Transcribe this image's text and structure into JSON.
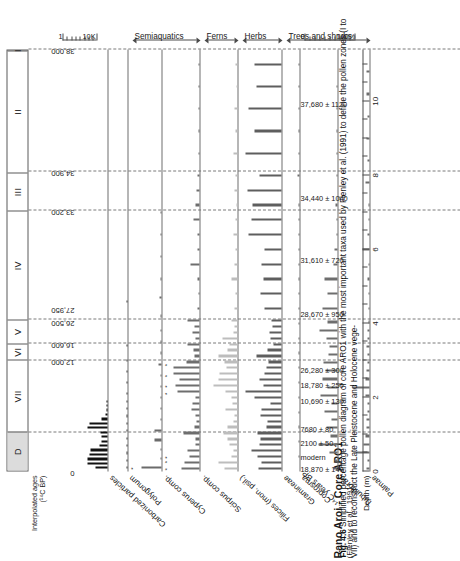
{
  "figure": {
    "title": "Rano Aroi - Core ARO1",
    "subtitle": "(Flenley et al., 1991)",
    "caption_number": "Fig. 4.6",
    "caption_text": "Simplified percentage pollen diagram of core ARO1 with the most important taxa used by Flenley et al. (1991) to define the pollen zones (I to VII) and to reconstruct the Late Pleistocene and Holocene vege-"
  },
  "zones": {
    "header_labels": [
      "D",
      "VII",
      "VI",
      "V",
      "IV",
      "III",
      "II",
      "I"
    ],
    "boundaries_depth_m": [
      1.05,
      3.0,
      3.45,
      4.1,
      7.05,
      8.1,
      11.4
    ]
  },
  "ages": {
    "row_title": "Interpolated ages (¹⁴C BP)",
    "labels": [
      "0",
      "12,000",
      "16,600",
      "26,500",
      "27,950",
      "33,200",
      "34,900",
      "38,000"
    ],
    "depths_m": [
      0.0,
      3.0,
      3.45,
      4.05,
      4.4,
      7.05,
      8.1,
      11.4
    ]
  },
  "axes": {
    "depth_title": "Depth (m)",
    "depth_ticks": [
      0,
      2,
      4,
      6,
      8,
      10
    ],
    "depth_min_m": 0,
    "depth_max_m": 11.4,
    "percent_scale": {
      "min_label": "0",
      "max_label": "100%"
    },
    "charcoal_scale": {
      "min_label": "1",
      "max_label": "10K"
    }
  },
  "c14_dates": {
    "row_title": "¹⁴C years BP",
    "entries": [
      {
        "label": "18,870 ± 140",
        "depth_m": 0.08
      },
      {
        "label": "modern",
        "depth_m": 0.4
      },
      {
        "label": "2100 ± 50",
        "depth_m": 0.78
      },
      {
        "label": "7680 ± 80",
        "depth_m": 1.16
      },
      {
        "label": "10,690 ± 130",
        "depth_m": 1.92
      },
      {
        "label": "18,780 ± 250",
        "depth_m": 2.34
      },
      {
        "label": "26,280 ± 300",
        "depth_m": 2.76
      },
      {
        "label": "28,670 ± 950",
        "depth_m": 4.28
      },
      {
        "label": "31,610 ± 720",
        "depth_m": 5.72
      },
      {
        "label": "34,440 ± 1040",
        "depth_m": 7.4
      },
      {
        "label": "37,680 ± 1120",
        "depth_m": 9.95
      }
    ]
  },
  "groups": [
    {
      "label": "Trees and shrubs",
      "from_panel": 8,
      "to_panel": 6
    },
    {
      "label": "Herbs",
      "from_panel": 5,
      "to_panel": 5
    },
    {
      "label": "Ferns",
      "from_panel": 4,
      "to_panel": 4
    },
    {
      "label": "Semiaquatics",
      "from_panel": 3,
      "to_panel": 2
    }
  ],
  "chart_data": {
    "type": "bar",
    "xlabel": "Depth (m)",
    "ylabel": "Percentage (0-100%)",
    "xlim": [
      0,
      11.4
    ],
    "grid": "dashed vertical zone boundaries",
    "legend": "none",
    "orientation": "panels stacked, depth on horizontal axis",
    "series": [
      {
        "name": "Carbonized particles",
        "color": "#111111",
        "scale": "1 - 10K",
        "x": [
          0.1,
          0.22,
          0.34,
          0.46,
          0.58,
          0.7,
          0.82,
          0.94,
          1.06,
          1.18,
          1.3,
          1.42,
          1.54,
          1.66,
          1.78,
          1.9
        ],
        "values": [
          44,
          72,
          70,
          64,
          60,
          30,
          22,
          20,
          26,
          70,
          64,
          22,
          8,
          5,
          3,
          2
        ]
      },
      {
        "name": "Polygonum",
        "color": "#3f3f3f",
        "x": [
          0.1,
          0.3,
          0.5,
          0.7,
          0.9,
          1.1,
          1.3,
          1.5,
          1.7,
          1.9,
          2.1,
          2.4,
          2.7,
          3.0,
          3.4,
          4.6
        ],
        "values": [
          9,
          4,
          3,
          2,
          5,
          3,
          4,
          3,
          2,
          3,
          2,
          2,
          1,
          2,
          1,
          3
        ]
      },
      {
        "name": "Cyperus comp.",
        "color": "#6b6b6b",
        "x": [
          0.1,
          0.35,
          0.6,
          0.85,
          1.1,
          1.4,
          1.7,
          2.0,
          2.3,
          2.6,
          2.9,
          3.2,
          3.5,
          3.8,
          4.2,
          4.7,
          5.2,
          5.8,
          6.4,
          7.0
        ],
        "values": [
          72,
          4,
          3,
          25,
          24,
          3,
          2,
          2,
          2,
          2,
          12,
          3,
          2,
          5,
          4,
          6,
          4,
          3,
          2,
          2
        ],
        "stars_x": [
          0.1
        ]
      },
      {
        "name": "Scirpus comp.",
        "color": "#6e6e6e",
        "x": [
          0.08,
          0.24,
          0.4,
          0.56,
          0.72,
          0.88,
          1.04,
          1.2,
          1.36,
          1.52,
          1.68,
          1.84,
          2.0,
          2.16,
          2.32,
          2.48,
          2.64,
          2.8,
          2.96,
          3.12,
          3.28,
          3.44,
          3.6,
          3.76,
          3.92,
          4.08,
          4.4,
          4.8,
          5.2,
          5.6,
          6.0,
          6.4,
          6.8,
          7.2,
          7.6,
          8.0,
          8.6,
          9.2,
          9.8,
          10.4,
          11.0
        ],
        "values": [
          56,
          48,
          30,
          38,
          14,
          12,
          50,
          16,
          10,
          14,
          26,
          22,
          14,
          70,
          76,
          64,
          80,
          80,
          40,
          16,
          18,
          36,
          14,
          22,
          16,
          38,
          6,
          4,
          6,
          28,
          6,
          5,
          20,
          14,
          10,
          6,
          4,
          3,
          3,
          2,
          2
        ],
        "stars_x": [
          0.08,
          0.28,
          0.4,
          2.12,
          2.32,
          2.6,
          2.9
        ]
      },
      {
        "name": "Filices (mon. psil.)",
        "color": "#bdbdbd",
        "x": [
          0.08,
          0.24,
          0.4,
          0.56,
          0.72,
          0.88,
          1.04,
          1.2,
          1.36,
          1.52,
          1.68,
          1.84,
          2.0,
          2.16,
          2.32,
          2.48,
          2.64,
          2.8,
          2.96,
          3.12,
          3.28,
          3.44,
          3.6,
          3.76,
          3.92,
          4.08,
          4.4,
          4.8,
          5.2,
          5.6,
          6.0,
          6.4,
          6.8,
          7.2,
          7.6,
          8.0,
          8.6,
          9.2,
          9.8,
          10.4,
          11.0
        ],
        "values": [
          42,
          60,
          20,
          14,
          26,
          30,
          44,
          32,
          14,
          10,
          38,
          16,
          20,
          38,
          76,
          58,
          56,
          34,
          40,
          58,
          30,
          26,
          48,
          14,
          10,
          18,
          8,
          6,
          18,
          10,
          6,
          14,
          6,
          4,
          8,
          6,
          14,
          6,
          10,
          4,
          6
        ]
      },
      {
        "name": "Gramineae",
        "color": "#5e5e5e",
        "x": [
          0.08,
          0.24,
          0.4,
          0.56,
          0.72,
          0.88,
          1.04,
          1.2,
          1.36,
          1.52,
          1.68,
          1.84,
          2.0,
          2.16,
          2.32,
          2.48,
          2.64,
          2.8,
          2.96,
          3.12,
          3.28,
          3.44,
          3.6,
          3.76,
          3.92,
          4.08,
          4.4,
          4.8,
          5.2,
          5.6,
          6.0,
          6.4,
          6.8,
          7.2,
          7.6,
          8.0,
          8.6,
          9.2,
          9.8,
          10.4,
          11.0
        ],
        "values": [
          60,
          52,
          62,
          78,
          58,
          54,
          62,
          40,
          36,
          54,
          52,
          30,
          70,
          96,
          48,
          58,
          46,
          40,
          34,
          66,
          36,
          22,
          28,
          32,
          24,
          26,
          46,
          56,
          48,
          52,
          44,
          86,
          80,
          76,
          90,
          58,
          96,
          70,
          88,
          66,
          72
        ]
      },
      {
        "name": "Coprosma",
        "color": "#6e6e6e",
        "x": [
          0.4,
          0.8,
          1.2,
          1.6,
          2.0,
          2.4,
          2.8,
          3.2,
          3.6,
          4.0,
          4.4,
          4.8,
          5.2,
          5.6,
          6.0,
          6.4,
          6.8,
          7.2,
          8.0,
          8.6,
          9.2,
          9.8,
          10.4,
          11.0
        ],
        "values": [
          4,
          6,
          5,
          8,
          10,
          6,
          8,
          12,
          7,
          6,
          10,
          8,
          6,
          5,
          7,
          6,
          5,
          4,
          14,
          10,
          8,
          12,
          6,
          5
        ]
      },
      {
        "name": "Tubuliflorae",
        "color": "#6e6e6e",
        "x": [
          0.08,
          0.3,
          0.52,
          0.74,
          0.96,
          1.18,
          1.4,
          1.62,
          1.84,
          2.06,
          2.28,
          2.5,
          2.72,
          2.94,
          3.16,
          3.38,
          3.6,
          3.82,
          4.04,
          4.4,
          4.8,
          5.2,
          5.6,
          6.0,
          6.4,
          6.8,
          7.2,
          8.0,
          8.6,
          9.2,
          9.8,
          10.4
        ],
        "values": [
          14,
          8,
          26,
          60,
          22,
          34,
          18,
          40,
          20,
          52,
          30,
          46,
          36,
          44,
          28,
          24,
          34,
          56,
          32,
          48,
          30,
          40,
          12,
          8,
          4,
          3,
          6,
          4,
          3,
          3,
          2,
          2
        ]
      },
      {
        "name": "Palmae",
        "color": "#6e6e6e",
        "x": [
          0.08,
          0.3,
          0.52,
          0.74,
          0.96,
          1.18,
          1.4,
          1.62,
          1.84,
          2.06,
          2.28,
          2.5,
          2.72,
          2.94,
          3.16,
          3.38,
          3.6,
          3.82,
          4.04,
          4.4,
          4.8,
          5.2,
          5.6,
          6.0,
          6.4,
          6.8,
          7.2,
          7.8,
          8.4,
          9.0,
          9.6,
          10.2,
          10.8
        ],
        "values": [
          10,
          6,
          50,
          22,
          14,
          10,
          12,
          8,
          6,
          14,
          66,
          16,
          10,
          8,
          6,
          10,
          8,
          6,
          4,
          4,
          3,
          6,
          4,
          28,
          6,
          4,
          3,
          14,
          8,
          10,
          6,
          12,
          10
        ]
      }
    ]
  }
}
